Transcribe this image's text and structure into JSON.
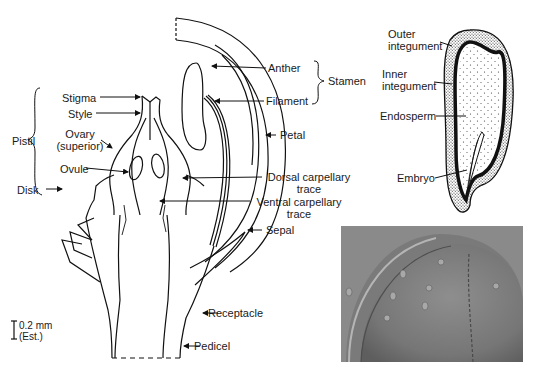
{
  "figure": {
    "flower_section": {
      "labels": {
        "stigma": "Stigma",
        "style": "Style",
        "pistil": "Pistil",
        "ovary_1": "Ovary",
        "ovary_2": "(superior)",
        "ovule": "Ovule",
        "disk": "Disk",
        "anther": "Anther",
        "filament": "Filament",
        "stamen": "Stamen",
        "petal": "Petal",
        "dorsal_1": "Dorsal carpellary",
        "dorsal_2": "trace",
        "ventral_1": "Ventral carpellary",
        "ventral_2": "trace",
        "sepal": "Sepal",
        "receptacle": "Receptacle",
        "pedicel": "Pedicel"
      },
      "scale_bar": {
        "value": "0.2 mm",
        "note": "(Est.)"
      }
    },
    "seed_section": {
      "labels": {
        "outer_1": "Outer",
        "outer_2": "integument",
        "inner_1": "Inner",
        "inner_2": "integument",
        "endosperm": "Endosperm",
        "embryo": "Embryo"
      }
    },
    "micrograph": {
      "description": "Grayscale SEM micrograph of fruit/ovary surface"
    }
  }
}
